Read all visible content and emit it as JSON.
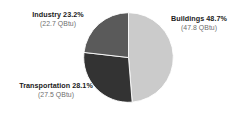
{
  "chart_data": {
    "type": "pie",
    "title": "",
    "subtitle": "",
    "xlabel": "",
    "ylabel": "",
    "legend_position": "none",
    "grid": false,
    "unit": "QBtu",
    "total_value": 98.0,
    "start_angle_deg": 0,
    "direction": "clockwise",
    "categories": [
      "Buildings",
      "Transportation",
      "Industry"
    ],
    "values": [
      48.7,
      28.1,
      23.2
    ],
    "absolute_values": [
      47.8,
      27.5,
      22.7
    ],
    "colors": [
      "#cbcbcb",
      "#333333",
      "#5a5a5a"
    ],
    "slices": [
      {
        "name": "Buildings",
        "percent": 48.7,
        "percent_label": "48.7%",
        "value": 47.8,
        "value_label": "(47.8 QBtu)",
        "title_label": "Buildings 48.7%",
        "color": "#cbcbcb",
        "start_angle_deg": 0,
        "end_angle_deg": 175.3
      },
      {
        "name": "Transportation",
        "percent": 28.1,
        "percent_label": "28.1%",
        "value": 27.5,
        "value_label": "(27.5 QBtu)",
        "title_label": "Transportation 28.1%",
        "color": "#333333",
        "start_angle_deg": 175.3,
        "end_angle_deg": 276.5
      },
      {
        "name": "Industry",
        "percent": 23.2,
        "percent_label": "23.2%",
        "value": 22.7,
        "value_label": "(22.7 QBtu)",
        "title_label": "Industry 23.2%",
        "color": "#5a5a5a",
        "start_angle_deg": 276.5,
        "end_angle_deg": 360
      }
    ]
  },
  "labels": {
    "buildings": {
      "title": "Buildings 48.7%",
      "value": "(47.8 QBtu)"
    },
    "transportation": {
      "title": "Transportation 28.1%",
      "value": "(27.5 QBtu)"
    },
    "industry": {
      "title": "Industry 23.2%",
      "value": "(22.7 QBtu)"
    }
  },
  "style": {
    "background": "#ffffff",
    "title_color": "#1b1b1b",
    "value_color": "#6e6e6e",
    "slice_separator_color": "#ffffff"
  }
}
